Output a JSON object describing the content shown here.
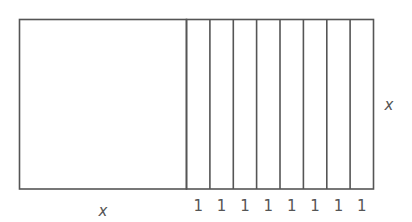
{
  "diagram": {
    "stroke_color": "#555555",
    "label_color": "#555555",
    "square": {
      "side_label_bottom": "x"
    },
    "strips": {
      "count": 8,
      "width_labels": [
        "1",
        "1",
        "1",
        "1",
        "1",
        "1",
        "1",
        "1"
      ]
    },
    "height_label_right": "x"
  }
}
